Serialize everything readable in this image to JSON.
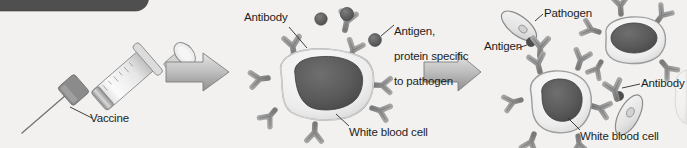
{
  "figure": {
    "background_color": "#f2f1ef",
    "top_bar_color": "#4f4f4f",
    "ink_color": "#1d1d1d",
    "cell_body_color": "#efefef",
    "nucleus_color": "#5d5d5d",
    "receptor_color": "#8c8c8c",
    "antigen_color": "#6a6a6a",
    "arrow_color": "#b0b0b0"
  },
  "panels": {
    "left": {
      "name": "vaccination-panel",
      "labels": {
        "vaccine": "Vaccine"
      }
    },
    "middle": {
      "name": "antibody-production-panel",
      "labels": {
        "antibody": "Antibody",
        "antigen_note": "Antigen,\nprotein specific\nto pathogen",
        "antigen_note_line1": "Antigen,",
        "antigen_note_line2": "protein specific",
        "antigen_note_line3": "to pathogen",
        "white_blood_cell": "White blood cell"
      }
    },
    "right": {
      "name": "pathogen-recognition-panel",
      "labels": {
        "pathogen": "Pathogen",
        "antigen": "Antigen",
        "antibody": "Antibody",
        "white_blood_cell": "White blood cell"
      }
    }
  },
  "arrows": [
    {
      "name": "arrow-left-to-middle",
      "label": ""
    },
    {
      "name": "arrow-middle-to-right",
      "label": ""
    }
  ],
  "icons": {
    "syringe": "syringe-icon",
    "arrow": "right-arrow-icon",
    "white_blood_cell": "white-blood-cell-icon",
    "antibody": "y-shaped-antibody-icon",
    "antigen": "antigen-dot-icon",
    "pathogen": "pathogen-icon"
  }
}
